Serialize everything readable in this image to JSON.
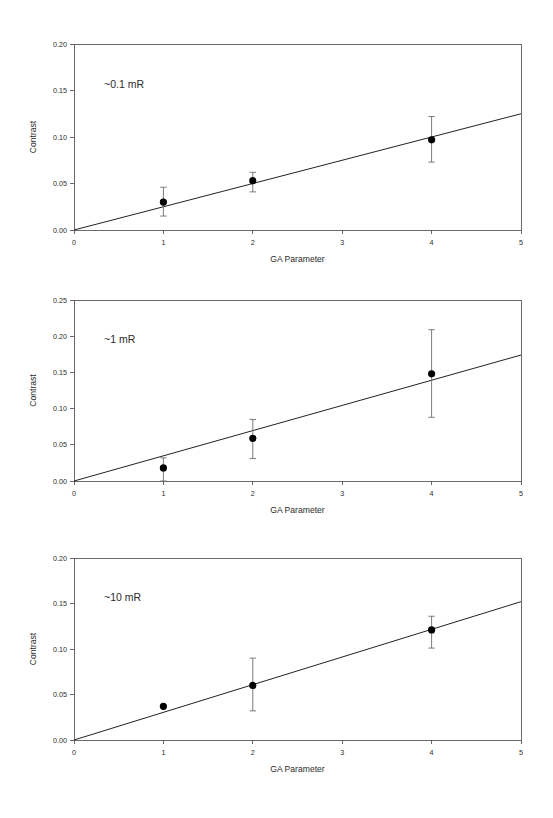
{
  "figure": {
    "background": "#ffffff",
    "panel_count": 3,
    "marker_color": "#000000",
    "line_color": "#222222",
    "axis_color": "#5a5a5a"
  },
  "chart_data": [
    {
      "type": "scatter",
      "title": "",
      "annotation": "~0.1 mR",
      "xlabel": "GA Parameter",
      "ylabel": "Contrast",
      "xlim": [
        0,
        5
      ],
      "ylim": [
        0,
        0.2
      ],
      "xticks": [
        0,
        1,
        2,
        3,
        4,
        5
      ],
      "xticklabels": [
        "0",
        "1",
        "2",
        "3",
        "4",
        "5"
      ],
      "yticks": [
        0.0,
        0.05,
        0.1,
        0.15,
        0.2
      ],
      "yticklabels": [
        "0.00",
        "0.05",
        "0.10",
        "0.15",
        "0.20"
      ],
      "grid": false,
      "legend": "none",
      "x": [
        1,
        2,
        4
      ],
      "y": [
        0.03,
        0.053,
        0.097
      ],
      "yerr_lower": [
        0.015,
        0.041,
        0.073
      ],
      "yerr_upper": [
        0.046,
        0.062,
        0.122
      ],
      "fit_line": {
        "x": [
          0,
          5
        ],
        "y": [
          0.0,
          0.125
        ]
      }
    },
    {
      "type": "scatter",
      "title": "",
      "annotation": "~1 mR",
      "xlabel": "GA Parameter",
      "ylabel": "Contrast",
      "xlim": [
        0,
        5
      ],
      "ylim": [
        0,
        0.25
      ],
      "xticks": [
        0,
        1,
        2,
        3,
        4,
        5
      ],
      "xticklabels": [
        "0",
        "1",
        "2",
        "3",
        "4",
        "5"
      ],
      "yticks": [
        0.0,
        0.05,
        0.1,
        0.15,
        0.2,
        0.25
      ],
      "yticklabels": [
        "0.00",
        "0.05",
        "0.10",
        "0.15",
        "0.20",
        "0.25"
      ],
      "grid": false,
      "legend": "none",
      "x": [
        1,
        2,
        4
      ],
      "y": [
        0.018,
        0.059,
        0.148
      ],
      "yerr_lower": [
        0.0,
        0.031,
        0.088
      ],
      "yerr_upper": [
        0.032,
        0.085,
        0.209
      ],
      "fit_line": {
        "x": [
          0,
          5
        ],
        "y": [
          0.0,
          0.174
        ]
      }
    },
    {
      "type": "scatter",
      "title": "",
      "annotation": "~10 mR",
      "xlabel": "GA Parameter",
      "ylabel": "Contrast",
      "xlim": [
        0,
        5
      ],
      "ylim": [
        0,
        0.2
      ],
      "xticks": [
        0,
        1,
        2,
        3,
        4,
        5
      ],
      "xticklabels": [
        "0",
        "1",
        "2",
        "3",
        "4",
        "5"
      ],
      "yticks": [
        0.0,
        0.05,
        0.1,
        0.15,
        0.2
      ],
      "yticklabels": [
        "0.00",
        "0.05",
        "0.10",
        "0.15",
        "0.20"
      ],
      "grid": false,
      "legend": "none",
      "x": [
        1,
        2,
        4
      ],
      "y": [
        0.037,
        0.06,
        0.121
      ],
      "yerr_lower": [
        0.037,
        0.032,
        0.101
      ],
      "yerr_upper": [
        0.037,
        0.09,
        0.136
      ],
      "fit_line": {
        "x": [
          0,
          5
        ],
        "y": [
          0.0,
          0.152
        ]
      }
    }
  ]
}
